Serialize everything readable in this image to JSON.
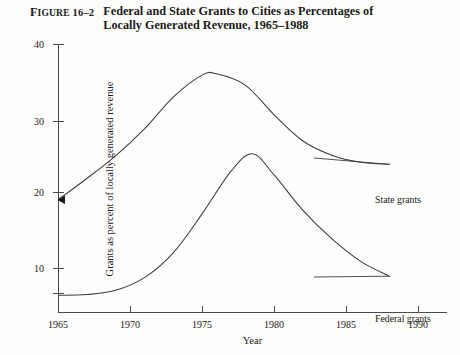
{
  "figure": {
    "label_lead": "F",
    "label_smallcaps": "IGURE",
    "label_number": " 16–2",
    "title": "Federal and State Grants to Cities as Percentages of Locally Generated Revenue, 1965–1988"
  },
  "axes": {
    "x_title": "Year",
    "y_title": "Grants as percent of locally generated revenue",
    "x_ticks": [
      "1965",
      "1970",
      "1975",
      "1980",
      "1985",
      "1990"
    ],
    "y_ticks": [
      "10",
      "20",
      "30",
      "40"
    ]
  },
  "legend": {
    "state": "State grants",
    "federal": "Federal grants"
  },
  "colors": {
    "background": "#fdfdfb",
    "axis": "#4a4a4a",
    "curve": "#3c3c3c",
    "text": "#1a1a1a"
  },
  "chart_data": {
    "type": "line",
    "title": "Federal and State Grants to Cities as Percentages of Locally Generated Revenue, 1965–1988",
    "xlabel": "Year",
    "ylabel": "Grants as percent of locally generated revenue",
    "xlim": [
      1965,
      1992
    ],
    "ylim": [
      4,
      42
    ],
    "grid": false,
    "legend_position": "inline-right",
    "x_ticks": [
      1965,
      1970,
      1975,
      1980,
      1985,
      1990
    ],
    "y_ticks": [
      10,
      20,
      30,
      40
    ],
    "annotations": [
      {
        "text": "arrowhead marker at series start",
        "x": 1965,
        "y": 20,
        "series": "State grants"
      }
    ],
    "series": [
      {
        "name": "State grants",
        "x": [
          1965,
          1967,
          1969,
          1971,
          1973,
          1975,
          1976,
          1978,
          1980,
          1982,
          1984,
          1986,
          1988
        ],
        "values": [
          20.0,
          23.0,
          26.2,
          30.0,
          34.5,
          37.6,
          37.8,
          36.2,
          32.0,
          28.3,
          26.3,
          25.3,
          25.0
        ]
      },
      {
        "name": "Federal grants",
        "x": [
          1965,
          1967,
          1969,
          1971,
          1973,
          1975,
          1977,
          1978.5,
          1980,
          1982,
          1984,
          1986,
          1988
        ],
        "values": [
          6.5,
          6.6,
          7.2,
          9.0,
          12.5,
          18.0,
          24.0,
          26.5,
          23.5,
          18.5,
          14.5,
          11.3,
          9.2
        ]
      }
    ]
  }
}
